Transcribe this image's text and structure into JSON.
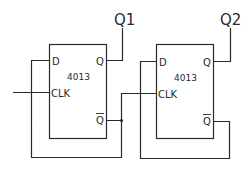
{
  "diagram": {
    "type": "circuit-schematic",
    "colors": {
      "line": "#2a2a2a",
      "background": "#ffffff"
    },
    "flipflops": [
      {
        "id": "ff1",
        "part": "4013",
        "pins": {
          "d": "D",
          "clk": "CLK",
          "q": "Q",
          "qbar": "Q"
        },
        "output_label": "Q1"
      },
      {
        "id": "ff2",
        "part": "4013",
        "pins": {
          "d": "D",
          "clk": "CLK",
          "q": "Q",
          "qbar": "Q"
        },
        "output_label": "Q2"
      }
    ],
    "connections": [
      "External clock input -> FF1 CLK",
      "FF1 Q-bar -> FF1 D (feedback)",
      "FF1 Q-bar -> FF2 CLK",
      "FF2 Q-bar -> FF2 D (feedback)",
      "FF1 Q -> Q1 output",
      "FF2 Q -> Q2 output"
    ]
  }
}
